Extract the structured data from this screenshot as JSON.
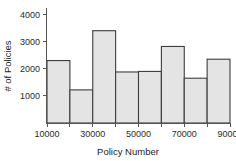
{
  "chart_data": {
    "type": "bar",
    "title": "",
    "subtitle": "",
    "xlabel": "Policy Number",
    "ylabel": "# of Policies",
    "categories": [
      "10000-20000",
      "20000-30000",
      "30000-40000",
      "40000-50000",
      "50000-60000",
      "60000-70000",
      "70000-80000",
      "80000-90000"
    ],
    "bin_edges": [
      10000,
      20000,
      30000,
      40000,
      50000,
      60000,
      70000,
      80000,
      90000
    ],
    "values": [
      2300,
      1220,
      3400,
      1880,
      1900,
      2820,
      1650,
      2350
    ],
    "xlim": [
      10000,
      90000
    ],
    "ylim": [
      0,
      4200
    ],
    "x_tick_values": [
      10000,
      30000,
      50000,
      70000,
      90000
    ],
    "x_tick_labels": [
      "10000",
      "30000",
      "50000",
      "70000",
      "90000"
    ],
    "y_tick_values": [
      1000,
      2000,
      3000,
      4000
    ],
    "y_tick_labels": [
      "1000",
      "2000",
      "3000",
      "4000"
    ],
    "grid": false,
    "legend": false,
    "legend_position": "none",
    "bar_fill_color": "#e4e4e4",
    "bar_edge_color": "#3d3d3d",
    "axis_color": "#555555",
    "background_color": "#ffffff"
  }
}
